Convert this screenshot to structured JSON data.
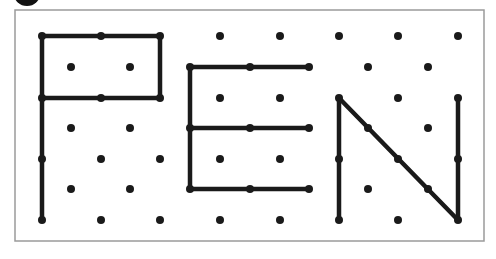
{
  "figure": {
    "word": "PEN",
    "colors": {
      "line": "#1a1a1a",
      "dot": "#1a1a1a",
      "frame": "#9a9a9a",
      "background": "#ffffff"
    },
    "frame": {
      "x": 15,
      "y": 10,
      "width": 469,
      "height": 231
    },
    "dot_radius": 4,
    "line_width": 4.5,
    "grid": {
      "aligned_rows": {
        "y": [
          36,
          98,
          159,
          220
        ],
        "x": [
          42,
          101,
          160,
          220,
          280,
          339,
          398,
          458
        ]
      },
      "offset_rows": {
        "y": [
          67,
          128,
          189
        ],
        "x": [
          71,
          130,
          190,
          250,
          309,
          368,
          428
        ]
      }
    },
    "letters": [
      {
        "letter": "P",
        "segments": [
          [
            42,
            36,
            42,
            220
          ],
          [
            42,
            36,
            160,
            36
          ],
          [
            160,
            36,
            160,
            98
          ],
          [
            42,
            98,
            160,
            98
          ]
        ]
      },
      {
        "letter": "E",
        "segments": [
          [
            190,
            67,
            190,
            189
          ],
          [
            190,
            67,
            309,
            67
          ],
          [
            190,
            128,
            309,
            128
          ],
          [
            190,
            189,
            309,
            189
          ]
        ]
      },
      {
        "letter": "N",
        "segments": [
          [
            339,
            98,
            339,
            220
          ],
          [
            339,
            98,
            458,
            220
          ],
          [
            458,
            98,
            458,
            220
          ]
        ]
      }
    ],
    "extra_dots_on_lines": [
      [
        368,
        128
      ],
      [
        398,
        159
      ],
      [
        428,
        189
      ]
    ]
  }
}
